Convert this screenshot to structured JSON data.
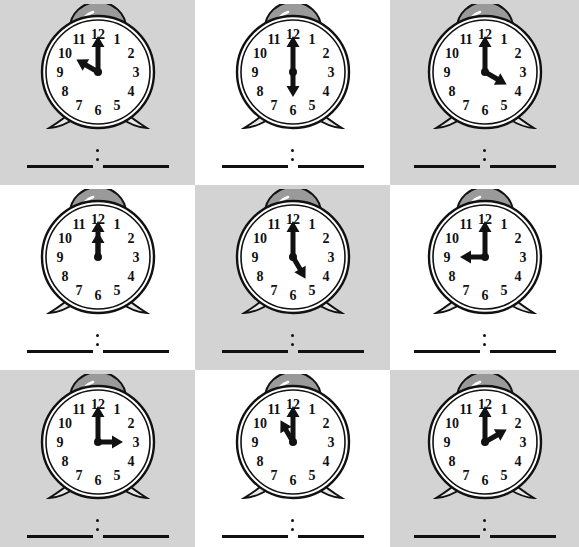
{
  "worksheet": {
    "title": "Telling Time Worksheet",
    "description": "Nine alarm clocks each showing an o'clock time, with blank answer lines below",
    "grid": {
      "rows": 3,
      "columns": 3
    },
    "colors": {
      "page_background": "#ffffff",
      "cell_shaded": "#d3d3d3",
      "ink": "#111111",
      "bell_fill": "#9a9a9a",
      "face_fill": "#ffffff"
    },
    "clock_numerals": [
      "12",
      "1",
      "2",
      "3",
      "4",
      "5",
      "6",
      "7",
      "8",
      "9",
      "10",
      "11"
    ],
    "answer_separator": ":"
  },
  "clocks": [
    {
      "index": 1,
      "position": "row1-col1",
      "background": "shaded",
      "time": "10:00",
      "hour": 10,
      "minute": 0,
      "hour_angle": 300,
      "minute_angle": 0,
      "answer_hour_blank": "",
      "answer_minute_blank": ""
    },
    {
      "index": 2,
      "position": "row1-col2",
      "background": "plain",
      "time": "6:00",
      "hour": 6,
      "minute": 0,
      "hour_angle": 180,
      "minute_angle": 0,
      "answer_hour_blank": "",
      "answer_minute_blank": ""
    },
    {
      "index": 3,
      "position": "row1-col3",
      "background": "shaded",
      "time": "4:00",
      "hour": 4,
      "minute": 0,
      "hour_angle": 120,
      "minute_angle": 0,
      "answer_hour_blank": "",
      "answer_minute_blank": ""
    },
    {
      "index": 4,
      "position": "row2-col1",
      "background": "plain",
      "time": "12:00",
      "hour": 12,
      "minute": 0,
      "hour_angle": 0,
      "minute_angle": 0,
      "answer_hour_blank": "",
      "answer_minute_blank": ""
    },
    {
      "index": 5,
      "position": "row2-col2",
      "background": "shaded",
      "time": "5:00",
      "hour": 5,
      "minute": 0,
      "hour_angle": 150,
      "minute_angle": 0,
      "answer_hour_blank": "",
      "answer_minute_blank": ""
    },
    {
      "index": 6,
      "position": "row2-col3",
      "background": "plain",
      "time": "9:00",
      "hour": 9,
      "minute": 0,
      "hour_angle": 270,
      "minute_angle": 0,
      "answer_hour_blank": "",
      "answer_minute_blank": ""
    },
    {
      "index": 7,
      "position": "row3-col1",
      "background": "shaded",
      "time": "3:00",
      "hour": 3,
      "minute": 0,
      "hour_angle": 90,
      "minute_angle": 0,
      "answer_hour_blank": "",
      "answer_minute_blank": ""
    },
    {
      "index": 8,
      "position": "row3-col2",
      "background": "plain",
      "time": "11:00",
      "hour": 11,
      "minute": 0,
      "hour_angle": 330,
      "minute_angle": 0,
      "answer_hour_blank": "",
      "answer_minute_blank": ""
    },
    {
      "index": 9,
      "position": "row3-col3",
      "background": "shaded",
      "time": "2:00",
      "hour": 2,
      "minute": 0,
      "hour_angle": 60,
      "minute_angle": 0,
      "answer_hour_blank": "",
      "answer_minute_blank": ""
    }
  ]
}
